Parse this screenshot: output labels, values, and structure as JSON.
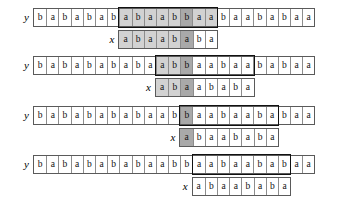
{
  "figure": {
    "alphabet": [
      "a",
      "b"
    ],
    "row_labels": {
      "y": "y",
      "x": "x"
    },
    "colors": {
      "background": "#ffffff",
      "cell_border": "#8d8d8d",
      "outer_border": "#5a5a5a",
      "window_border": "#111111",
      "shade_light": "#d2d2d2",
      "shade_dark": "#a9a9a9",
      "text": "#111111"
    },
    "cell_width_px": 12.2,
    "y_length": 23,
    "x_length": 8
  },
  "blocks": [
    {
      "name": "alignment-step-1",
      "y_label": "y",
      "x_label": "x",
      "y_string": [
        "b",
        "a",
        "b",
        "a",
        "b",
        "a",
        "b",
        "a",
        "b",
        "a",
        "a",
        "b",
        "b",
        "a",
        "a",
        "b",
        "a",
        "a",
        "b",
        "a",
        "b",
        "a",
        "a"
      ],
      "y_shading": [
        "none",
        "none",
        "none",
        "none",
        "none",
        "none",
        "none",
        "light",
        "light",
        "light",
        "light",
        "light",
        "dark",
        "light",
        "light",
        "none",
        "none",
        "none",
        "none",
        "none",
        "none",
        "none",
        "none"
      ],
      "x_string": [
        "a",
        "b",
        "a",
        "a",
        "b",
        "a",
        "b",
        "a"
      ],
      "x_shading": [
        "light",
        "light",
        "light",
        "light",
        "light",
        "dark",
        "none",
        "none"
      ],
      "window_start_index": 7,
      "window_length": 8,
      "x_offset_index": 7
    },
    {
      "name": "alignment-step-2",
      "y_label": "y",
      "x_label": "x",
      "y_string": [
        "b",
        "a",
        "b",
        "a",
        "b",
        "a",
        "b",
        "a",
        "b",
        "a",
        "a",
        "b",
        "b",
        "a",
        "a",
        "b",
        "a",
        "a",
        "b",
        "a",
        "b",
        "a",
        "a"
      ],
      "y_shading": [
        "none",
        "none",
        "none",
        "none",
        "none",
        "none",
        "none",
        "none",
        "none",
        "none",
        "light",
        "light",
        "dark",
        "none",
        "none",
        "none",
        "none",
        "none",
        "none",
        "none",
        "none",
        "none",
        "none"
      ],
      "x_string": [
        "a",
        "b",
        "a",
        "a",
        "b",
        "a",
        "b",
        "a"
      ],
      "x_shading": [
        "light",
        "light",
        "dark",
        "none",
        "none",
        "none",
        "none",
        "none"
      ],
      "window_start_index": 10,
      "window_length": 8,
      "x_offset_index": 10
    },
    {
      "name": "alignment-step-3",
      "y_label": "y",
      "x_label": "x",
      "y_string": [
        "b",
        "a",
        "b",
        "a",
        "b",
        "a",
        "b",
        "a",
        "b",
        "a",
        "a",
        "b",
        "b",
        "a",
        "a",
        "b",
        "a",
        "a",
        "b",
        "a",
        "b",
        "a",
        "a"
      ],
      "y_shading": [
        "none",
        "none",
        "none",
        "none",
        "none",
        "none",
        "none",
        "none",
        "none",
        "none",
        "none",
        "none",
        "dark",
        "none",
        "none",
        "none",
        "none",
        "none",
        "none",
        "none",
        "none",
        "none",
        "none"
      ],
      "x_string": [
        "a",
        "b",
        "a",
        "a",
        "b",
        "a",
        "b",
        "a"
      ],
      "x_shading": [
        "dark",
        "none",
        "none",
        "none",
        "none",
        "none",
        "none",
        "none"
      ],
      "window_start_index": 12,
      "window_length": 8,
      "x_offset_index": 12
    },
    {
      "name": "alignment-step-4",
      "y_label": "y",
      "x_label": "x",
      "y_string": [
        "b",
        "a",
        "b",
        "a",
        "b",
        "a",
        "b",
        "a",
        "b",
        "a",
        "a",
        "b",
        "b",
        "a",
        "a",
        "b",
        "a",
        "a",
        "b",
        "a",
        "b",
        "a",
        "a"
      ],
      "y_shading": [
        "none",
        "none",
        "none",
        "none",
        "none",
        "none",
        "none",
        "none",
        "none",
        "none",
        "none",
        "none",
        "none",
        "none",
        "none",
        "none",
        "none",
        "none",
        "none",
        "none",
        "none",
        "none",
        "none"
      ],
      "x_string": [
        "a",
        "b",
        "a",
        "a",
        "b",
        "a",
        "b",
        "a"
      ],
      "x_shading": [
        "none",
        "none",
        "none",
        "none",
        "none",
        "none",
        "none",
        "none"
      ],
      "window_start_index": 13,
      "window_length": 8,
      "x_offset_index": 13
    }
  ]
}
